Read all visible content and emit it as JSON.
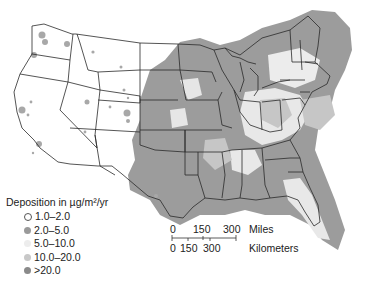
{
  "map": {
    "title": "",
    "region": "Contiguous United States"
  },
  "legend": {
    "title": "Deposition in µg/m²/yr",
    "items": [
      {
        "label": "1.0–2.0",
        "color": "#ffffff",
        "border": "#555555"
      },
      {
        "label": "2.0–5.0",
        "color": "#9a9a9a",
        "border": "#9a9a9a"
      },
      {
        "label": "5.0–10.0",
        "color": "#ededed",
        "border": "#ededed"
      },
      {
        "label": "10.0–20.0",
        "color": "#c8c8c8",
        "border": "#c8c8c8"
      },
      {
        "label": ">20.0",
        "color": "#8a8a8a",
        "border": "#8a8a8a"
      }
    ]
  },
  "scale_bar": {
    "miles_ticks": [
      "0",
      "150",
      "300"
    ],
    "miles_label": "Miles",
    "km_ticks": [
      "0",
      "150",
      "300"
    ],
    "km_label": "Kilometers"
  }
}
